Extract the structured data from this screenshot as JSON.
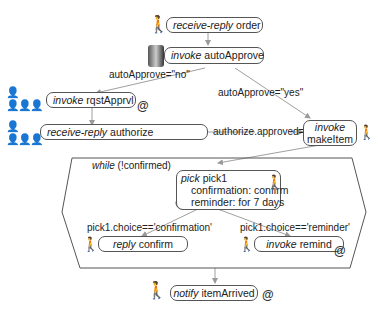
{
  "nodes": {
    "receive_order": {
      "kind": "receive-reply",
      "name": "order"
    },
    "invoke_autoapprove": {
      "kind": "invoke",
      "name": "autoApprove"
    },
    "invoke_rqstapprvl": {
      "kind": "invoke",
      "name": "rqstApprvl"
    },
    "receive_authorize": {
      "kind": "receive-reply",
      "name": "authorize"
    },
    "invoke_makeitem": {
      "kind": "invoke",
      "name": "makeItem"
    },
    "while_loop": {
      "kind": "while",
      "condition": "(!confirmed)"
    },
    "pick": {
      "kind": "pick",
      "name": "pick1",
      "line1": "confirmation: confirm",
      "line2": "reminder: for 7 days"
    },
    "reply_confirm": {
      "kind": "reply",
      "name": "confirm"
    },
    "invoke_remind": {
      "kind": "invoke",
      "name": "remind"
    },
    "notify_itemarrived": {
      "kind": "notify",
      "name": "itemArrived"
    }
  },
  "edges": {
    "auto_no": "autoApprove=\"no\"",
    "auto_yes": "autoApprove=\"yes\"",
    "authorized": "authorize.approved=='yes'",
    "choice_confirm": "pick1.choice=='confirmation'",
    "choice_remind": "pick1.choice=='reminder'"
  },
  "async_marker": "@",
  "colors": {
    "line": "#9a9a9a",
    "border": "#555555"
  }
}
